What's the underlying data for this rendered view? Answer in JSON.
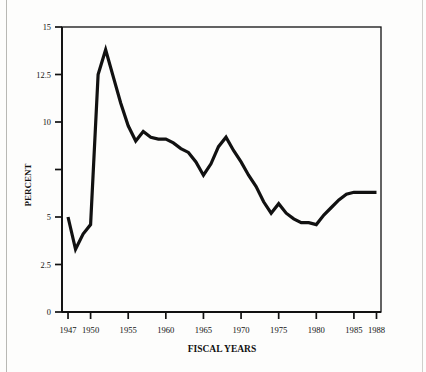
{
  "figure": {
    "kind": "line-chart",
    "background_color": "#fdfdfc",
    "ink_color": "#111111"
  },
  "chart_data": {
    "type": "line",
    "title": "",
    "xlabel": "FISCAL YEARS",
    "ylabel": "PERCENT",
    "xlim": [
      1946.2,
      1988.6
    ],
    "ylim": [
      0,
      15
    ],
    "grid": false,
    "legend": null,
    "line_color": "#111111",
    "line_width": 3.2,
    "xticks": [
      1947,
      1950,
      1955,
      1960,
      1965,
      1970,
      1975,
      1980,
      1985,
      1988
    ],
    "xtick_labels": [
      "1947",
      "1950",
      "1955",
      "1960",
      "1965",
      "1970",
      "1975",
      "1980",
      "1985",
      "1988"
    ],
    "yticks": [
      0,
      2.5,
      5,
      7.5,
      10,
      12.5,
      15
    ],
    "ytick_labels": [
      "0",
      "2.5",
      "5",
      "",
      "10",
      "12.5",
      "15"
    ],
    "x": [
      1947,
      1948,
      1949,
      1950,
      1951,
      1952,
      1953,
      1954,
      1955,
      1956,
      1957,
      1958,
      1959,
      1960,
      1961,
      1962,
      1963,
      1964,
      1965,
      1966,
      1967,
      1968,
      1969,
      1970,
      1971,
      1972,
      1973,
      1974,
      1975,
      1976,
      1977,
      1978,
      1979,
      1980,
      1981,
      1982,
      1983,
      1984,
      1985,
      1986,
      1987,
      1988
    ],
    "values": [
      5.0,
      3.3,
      4.1,
      4.6,
      12.5,
      13.8,
      12.4,
      11.0,
      9.8,
      9.0,
      9.5,
      9.2,
      9.1,
      9.1,
      8.9,
      8.6,
      8.4,
      7.9,
      7.2,
      7.8,
      8.7,
      9.2,
      8.5,
      7.9,
      7.2,
      6.6,
      5.8,
      5.2,
      5.7,
      5.2,
      4.9,
      4.7,
      4.7,
      4.6,
      5.1,
      5.5,
      5.9,
      6.2,
      6.3,
      6.3,
      6.3,
      6.3
    ]
  }
}
